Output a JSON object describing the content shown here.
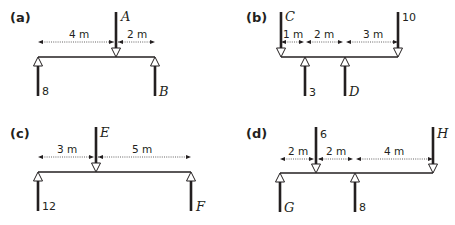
{
  "panels": [
    {
      "label": "(a)",
      "down_forces": [
        {
          "label": "A",
          "pos_m": 4,
          "kind": "var"
        }
      ],
      "up_forces": [
        {
          "label": "8",
          "pos_m": 0,
          "kind": "num"
        },
        {
          "label": "B",
          "pos_m": 6,
          "kind": "var"
        }
      ],
      "dimensions": [
        "4 m",
        "2 m"
      ]
    },
    {
      "label": "(b)",
      "down_forces": [
        {
          "label": "C",
          "pos_m": 0,
          "kind": "var"
        },
        {
          "label": "10",
          "pos_m": 6,
          "kind": "num"
        }
      ],
      "up_forces": [
        {
          "label": "3",
          "pos_m": 1,
          "kind": "num"
        },
        {
          "label": "D",
          "pos_m": 3,
          "kind": "var"
        }
      ],
      "dimensions": [
        "1 m",
        "2 m",
        "3 m"
      ]
    },
    {
      "label": "(c)",
      "down_forces": [
        {
          "label": "E",
          "pos_m": 3,
          "kind": "var"
        }
      ],
      "up_forces": [
        {
          "label": "12",
          "pos_m": 0,
          "kind": "num"
        },
        {
          "label": "F",
          "pos_m": 8,
          "kind": "var"
        }
      ],
      "dimensions": [
        "3 m",
        "5 m"
      ]
    },
    {
      "label": "(d)",
      "down_forces": [
        {
          "label": "6",
          "pos_m": 2,
          "kind": "num"
        },
        {
          "label": "H",
          "pos_m": 8,
          "kind": "var"
        }
      ],
      "up_forces": [
        {
          "label": "G",
          "pos_m": 0,
          "kind": "var"
        },
        {
          "label": "8",
          "pos_m": 4,
          "kind": "num"
        }
      ],
      "dimensions": [
        "2 m",
        "2 m",
        "4 m"
      ]
    }
  ]
}
